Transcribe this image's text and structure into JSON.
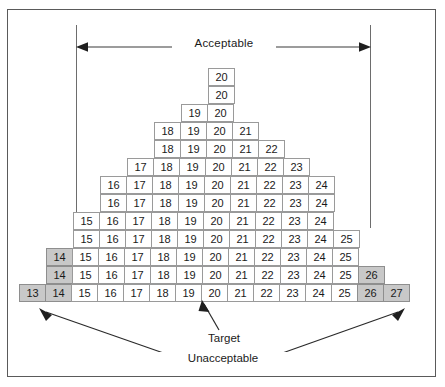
{
  "figure": {
    "type": "tolerance-stack-diagram",
    "labels": {
      "acceptable": "Acceptable",
      "target": "Target",
      "unacceptable": "Unacceptable"
    },
    "colors": {
      "shaded_cell": "#c8c8c8",
      "cell_border": "#9a9a9a",
      "frame_border": "#5a5a5a",
      "text": "#1a1a1a",
      "guide_line": "#6d6d6d"
    },
    "axis": {
      "min_value": 13,
      "max_value": 27,
      "target_value": 20,
      "acceptable_min": 15,
      "acceptable_max": 25,
      "unacceptable_values": [
        13,
        14,
        26,
        27
      ],
      "columns": 15,
      "rows": 13
    },
    "rows": [
      {
        "index": 1,
        "start": 20,
        "values": [
          20
        ],
        "shaded": []
      },
      {
        "index": 2,
        "start": 20,
        "values": [
          20
        ],
        "shaded": []
      },
      {
        "index": 3,
        "start": 19,
        "values": [
          19,
          20
        ],
        "shaded": []
      },
      {
        "index": 4,
        "start": 18,
        "values": [
          18,
          19,
          20,
          21
        ],
        "shaded": []
      },
      {
        "index": 5,
        "start": 18,
        "values": [
          18,
          19,
          20,
          21,
          22
        ],
        "shaded": []
      },
      {
        "index": 6,
        "start": 17,
        "values": [
          17,
          18,
          19,
          20,
          21,
          22,
          23
        ],
        "shaded": []
      },
      {
        "index": 7,
        "start": 16,
        "values": [
          16,
          17,
          18,
          19,
          20,
          21,
          22,
          23,
          24
        ],
        "shaded": []
      },
      {
        "index": 8,
        "start": 16,
        "values": [
          16,
          17,
          18,
          19,
          20,
          21,
          22,
          23,
          24
        ],
        "shaded": []
      },
      {
        "index": 9,
        "start": 15,
        "values": [
          15,
          16,
          17,
          18,
          19,
          20,
          21,
          22,
          23,
          24
        ],
        "shaded": []
      },
      {
        "index": 10,
        "start": 15,
        "values": [
          15,
          16,
          17,
          18,
          19,
          20,
          21,
          22,
          23,
          24,
          25
        ],
        "shaded": []
      },
      {
        "index": 11,
        "start": 14,
        "values": [
          14,
          15,
          16,
          17,
          18,
          19,
          20,
          21,
          22,
          23,
          24,
          25
        ],
        "shaded": [
          14
        ]
      },
      {
        "index": 12,
        "start": 14,
        "values": [
          14,
          15,
          16,
          17,
          18,
          19,
          20,
          21,
          22,
          23,
          24,
          25,
          26
        ],
        "shaded": [
          14,
          26
        ]
      },
      {
        "index": 13,
        "start": 13,
        "values": [
          13,
          14,
          15,
          16,
          17,
          18,
          19,
          20,
          21,
          22,
          23,
          24,
          25,
          26,
          27
        ],
        "shaded": [
          13,
          14,
          26,
          27
        ]
      }
    ]
  }
}
